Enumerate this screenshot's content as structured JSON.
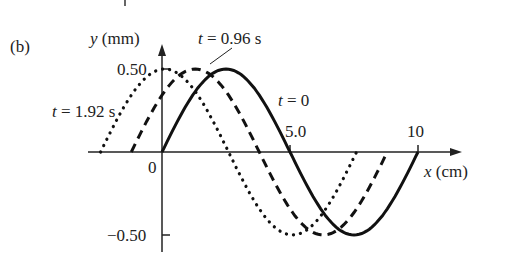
{
  "panel_label": "(b)",
  "chart_data": {
    "type": "line",
    "title": "",
    "xlabel": "x (cm)",
    "ylabel": "y (mm)",
    "xticks": [
      "0",
      "5.0",
      "10"
    ],
    "yticks": [
      "0.50",
      "-0.50"
    ],
    "xlim": [
      -3,
      18
    ],
    "ylim": [
      -0.55,
      0.6
    ],
    "wavelength_cm": 10,
    "amplitude_mm": 0.5,
    "series": [
      {
        "name": "t = 0",
        "style": "solid",
        "x_start_cm": 0,
        "x_end_cm": 10,
        "shift_cm": 0
      },
      {
        "name": "t = 0.96 s",
        "style": "dashed",
        "x_start_cm": -1.2,
        "x_end_cm": 8.8,
        "shift_cm": -1.2
      },
      {
        "name": "t = 1.92 s",
        "style": "dotted",
        "x_start_cm": -2.4,
        "x_end_cm": 7.6,
        "shift_cm": -2.4
      }
    ],
    "annotations": [
      "t = 0",
      "t = 0.96 s",
      "t = 1.92 s"
    ]
  },
  "labels": {
    "y_axis": {
      "var": "y",
      "unit": " (mm)"
    },
    "x_axis": {
      "var": "x",
      "unit": " (cm)"
    },
    "origin": "0",
    "x5": "5.0",
    "x10": "10",
    "y_pos": "0.50",
    "y_neg": "−0.50",
    "t0": {
      "var": "t",
      "rest": " = 0"
    },
    "t096": {
      "var": "t",
      "rest": " = 0.96 s"
    },
    "t192": {
      "var": "t",
      "rest": " = 1.92 s"
    }
  }
}
